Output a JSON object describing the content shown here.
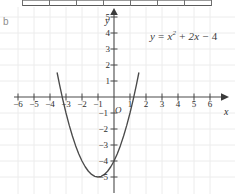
{
  "panel": {
    "label": "b"
  },
  "equation": {
    "lhs": "y",
    "eq": "=",
    "term1_base": "x",
    "term1_exp": "2",
    "plus": "+",
    "term2": "2x",
    "minus": "−",
    "term3": "4",
    "full": "y = x² + 2x − 4"
  },
  "axes": {
    "x_name": "x",
    "y_name": "y",
    "origin_label": "O"
  },
  "colors": {
    "grid": "#ececec",
    "axis": "#4a4a4a",
    "curve": "#4a4a4a",
    "text": "#2e2e2e",
    "panel_label": "#8d8d8d",
    "background": "#ffffff",
    "table_line": "#6f6f6f"
  },
  "chart_data": {
    "type": "line",
    "title": "",
    "subtitle": "",
    "xlabel": "x",
    "ylabel": "y",
    "equation": "y = x^2 + 2x - 4",
    "grid": true,
    "legend": "none",
    "annotations": [
      {
        "text": "y = x² + 2x − 4",
        "x": 2.4,
        "y": 4.6
      },
      {
        "text": "b",
        "x": -7.0,
        "y": 5.6
      }
    ],
    "xlim": [
      -7,
      7
    ],
    "ylim": [
      -5.6,
      5.8
    ],
    "xticks": [
      -6,
      -5,
      -4,
      -3,
      -2,
      -1,
      1,
      2,
      3,
      4,
      5,
      6
    ],
    "yticks": [
      -5,
      -4,
      -3,
      -2,
      -1,
      1,
      2,
      3,
      4,
      5
    ],
    "xticklabels": [
      "−6",
      "−5",
      "−4",
      "−3",
      "−2",
      "−1",
      "1",
      "2",
      "3",
      "4",
      "5",
      "6"
    ],
    "yticklabels": [
      "−5",
      "−4",
      "−3",
      "−2",
      "−1",
      "1",
      "2",
      "3",
      "4",
      "5"
    ],
    "vertex": {
      "x": -1,
      "y": -5
    },
    "roots": [
      -3.236,
      1.236
    ],
    "y_intercept": -4,
    "series": [
      {
        "name": "y = x^2 + 2x - 4",
        "x": [
          -3.55,
          -3.4,
          -3.2,
          -3.0,
          -2.8,
          -2.6,
          -2.4,
          -2.2,
          -2.0,
          -1.8,
          -1.6,
          -1.4,
          -1.2,
          -1.0,
          -0.8,
          -0.6,
          -0.4,
          -0.2,
          0.0,
          0.2,
          0.4,
          0.6,
          0.8,
          1.0,
          1.2,
          1.4,
          1.55
        ],
        "values": [
          1.5,
          0.76,
          -0.16,
          -1.0,
          -1.76,
          -2.44,
          -3.04,
          -3.56,
          -4.0,
          -4.36,
          -4.64,
          -4.84,
          -4.96,
          -5.0,
          -4.96,
          -4.84,
          -4.64,
          -4.36,
          -4.0,
          -3.56,
          -3.04,
          -2.44,
          -1.76,
          -1.0,
          -0.16,
          0.76,
          1.5
        ]
      }
    ]
  }
}
